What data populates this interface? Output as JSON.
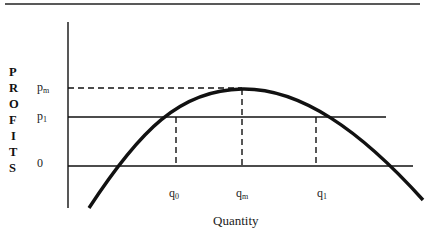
{
  "diagram": {
    "title": "",
    "y_axis_label_letters": [
      "P",
      "R",
      "O",
      "F",
      "I",
      "T",
      "S"
    ],
    "x_axis_label": "Quantity",
    "y_ticks": {
      "pm": {
        "main": "p",
        "sub": "m"
      },
      "p1": {
        "main": "p",
        "sub": "1"
      },
      "zero": "0"
    },
    "x_ticks": {
      "q0": {
        "main": "q",
        "sub": "0"
      },
      "qm": {
        "main": "q",
        "sub": "m"
      },
      "q1": {
        "main": "q",
        "sub": "1"
      }
    },
    "colors": {
      "line": "#111111",
      "background": "#ffffff"
    }
  }
}
